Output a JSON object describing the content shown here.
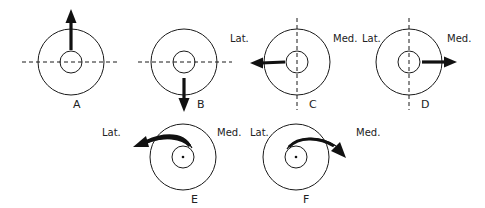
{
  "diagram": {
    "title": "",
    "stroke_color": "#1a1a1a",
    "background": "#ffffff",
    "panels": [
      {
        "id": "A",
        "label": "A",
        "center": [
          71,
          62
        ],
        "outer_radius": 33,
        "inner_radius": 11,
        "axis_line": "horizontal-dashed",
        "arrow": "straight-up",
        "side_labels": []
      },
      {
        "id": "B",
        "label": "B",
        "center": [
          184,
          62
        ],
        "outer_radius": 33,
        "inner_radius": 11,
        "axis_line": "horizontal-dashed",
        "arrow": "straight-down",
        "side_labels": []
      },
      {
        "id": "C",
        "label": "C",
        "center": [
          297,
          62
        ],
        "outer_radius": 33,
        "inner_radius": 11,
        "axis_line": "vertical-dashed",
        "arrow": "straight-left",
        "side_labels": [
          "Lat.",
          "Med."
        ]
      },
      {
        "id": "D",
        "label": "D",
        "center": [
          409,
          62
        ],
        "outer_radius": 33,
        "inner_radius": 11,
        "axis_line": "vertical-dashed",
        "arrow": "straight-right",
        "side_labels": [
          "Lat.",
          "Med."
        ]
      },
      {
        "id": "E",
        "label": "E",
        "center": [
          183,
          157
        ],
        "outer_radius": 33,
        "inner_radius": 11,
        "axis_line": "none",
        "center_dot": true,
        "arrow": "curved-toward-lateral",
        "side_labels": [
          "Lat.",
          "Med."
        ]
      },
      {
        "id": "F",
        "label": "F",
        "center": [
          296,
          157
        ],
        "outer_radius": 33,
        "inner_radius": 11,
        "axis_line": "none",
        "center_dot": true,
        "arrow": "curved-toward-medial",
        "side_labels": [
          "Lat.",
          "Med."
        ]
      }
    ],
    "direction_labels": {
      "c_lat": "Lat.",
      "c_med": "Med.",
      "d_lat": "Lat.",
      "d_med": "Med.",
      "e_lat": "Lat.",
      "e_med": "Med.",
      "f_lat": "Lat.",
      "f_med": "Med."
    }
  }
}
